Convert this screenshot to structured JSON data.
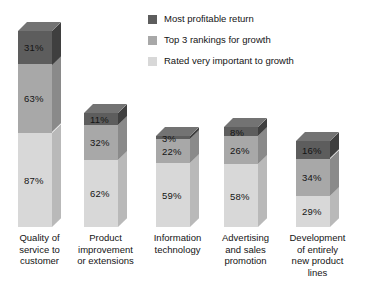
{
  "chart_data": {
    "type": "bar",
    "subtype": "stacked-bar-3d",
    "title": "",
    "subtitle": "",
    "xlabel": "",
    "ylabel": "",
    "grid": false,
    "legend_position": "top-center",
    "value_suffix": "%",
    "categories": [
      "Quality of service to customer",
      "Product improvement or extensions",
      "Information technology",
      "Advertising and sales promotion",
      "Development of entirely new product lines"
    ],
    "category_lines": [
      [
        "Quality of",
        "service to",
        "customer"
      ],
      [
        "Product",
        "improvement",
        "or extensions"
      ],
      [
        "Information",
        "technology"
      ],
      [
        "Advertising",
        "and sales",
        "promotion"
      ],
      [
        "Development",
        "of entirely",
        "new product",
        "lines"
      ]
    ],
    "series": [
      {
        "name": "Rated very important to growth",
        "color": "#d8d8d8",
        "values": [
          87,
          62,
          59,
          58,
          29
        ],
        "labels": [
          "87%",
          "62%",
          "59%",
          "58%",
          "29%"
        ]
      },
      {
        "name": "Top 3 rankings for growth",
        "color": "#a8a8a8",
        "values": [
          63,
          32,
          22,
          26,
          34
        ],
        "labels": [
          "63%",
          "32%",
          "22%",
          "26%",
          "34%"
        ]
      },
      {
        "name": "Most profitable return",
        "color": "#5d5d5d",
        "values": [
          31,
          11,
          3,
          8,
          16
        ],
        "labels": [
          "31%",
          "11%",
          "3%",
          "8%",
          "16%"
        ]
      }
    ],
    "stack_order_bottom_to_top": [
      "Rated very important to growth",
      "Top 3 rankings for growth",
      "Most profitable return"
    ],
    "totals": [
      181,
      105,
      84,
      92,
      79
    ],
    "ylim": [
      0,
      181
    ]
  },
  "legend": {
    "items": [
      {
        "label": "Most profitable return",
        "color": "#5d5d5d"
      },
      {
        "label": "Top 3 rankings for growth",
        "color": "#a8a8a8"
      },
      {
        "label": "Rated very important to growth",
        "color": "#d8d8d8"
      }
    ]
  },
  "style": {
    "background": "#ffffff",
    "text_color": "#141414",
    "dark_top": "#737373",
    "dark_side": "#3f3f3f",
    "mid_top": "#bdbdbd",
    "mid_side": "#8a8a8a",
    "light_top": "#e6e6e6",
    "light_side": "#b9b9b9"
  }
}
